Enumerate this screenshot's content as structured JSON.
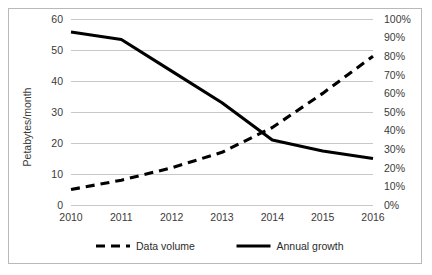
{
  "chart_data": {
    "type": "line",
    "title": "",
    "xlabel": "",
    "ylabel": "Petabytes/month",
    "y2label": "",
    "categories": [
      "2010",
      "2011",
      "2012",
      "2013",
      "2014",
      "2015",
      "2016"
    ],
    "ylim": [
      0,
      60
    ],
    "y2lim": [
      0,
      100
    ],
    "grid": true,
    "legend_position": "bottom",
    "y_ticks": [
      "0",
      "10",
      "20",
      "30",
      "40",
      "50",
      "60"
    ],
    "y2_ticks": [
      "0%",
      "10%",
      "20%",
      "30%",
      "40%",
      "50%",
      "60%",
      "70%",
      "80%",
      "90%",
      "100%"
    ],
    "series": [
      {
        "name": "Data volume",
        "axis": "left",
        "style": "dashed",
        "color": "#000000",
        "unit": "Petabytes/month",
        "values": [
          5,
          8,
          12,
          17,
          25,
          36,
          48
        ]
      },
      {
        "name": "Annual growth",
        "axis": "right",
        "style": "solid",
        "color": "#000000",
        "unit": "%",
        "values": [
          93,
          89,
          72,
          55,
          35,
          29,
          25
        ]
      }
    ]
  },
  "legend": {
    "items": [
      {
        "label": "Data volume",
        "style": "dashed"
      },
      {
        "label": "Annual growth",
        "style": "solid"
      }
    ]
  }
}
